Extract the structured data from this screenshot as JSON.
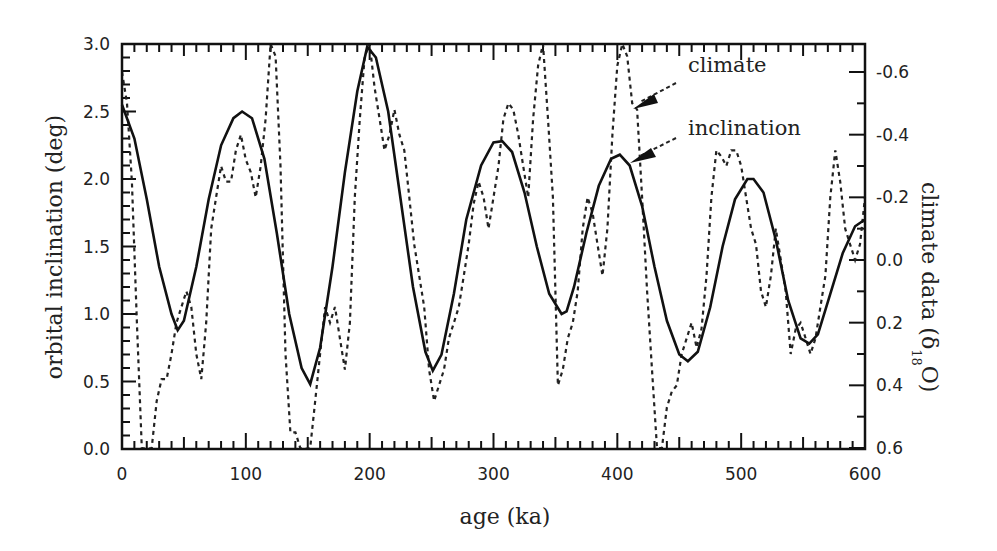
{
  "chart_data": {
    "type": "line",
    "title": "",
    "xlabel": "age (ka)",
    "ylabel": "orbital inclination (deg)",
    "ylabel_right": "climate data (δ18O)",
    "xlim": [
      0,
      600
    ],
    "ylim": [
      0.0,
      3.0
    ],
    "ylim_right": [
      0.6,
      -0.6
    ],
    "grid": false,
    "x_ticks": [
      "0",
      "100",
      "200",
      "300",
      "400",
      "500",
      "600"
    ],
    "y_ticks": [
      "0.0",
      "0.5",
      "1.0",
      "1.5",
      "2.0",
      "2.5",
      "3.0"
    ],
    "y_ticks_right": [
      "-0.6",
      "-0.4",
      "-0.2",
      "0.0",
      "0.2",
      "0.4",
      "0.6"
    ],
    "annotations": [
      {
        "text": "climate",
        "target_age": 413,
        "arrow": true
      },
      {
        "text": "inclination",
        "target_age": 405,
        "arrow": true
      }
    ],
    "series": [
      {
        "name": "inclination",
        "axis": "left",
        "style": "solid",
        "x": [
          0,
          10,
          20,
          30,
          40,
          45,
          50,
          60,
          70,
          80,
          90,
          97,
          105,
          115,
          125,
          135,
          145,
          152,
          160,
          170,
          180,
          190,
          198,
          205,
          215,
          225,
          235,
          245,
          251,
          258,
          268,
          278,
          290,
          300,
          307,
          315,
          325,
          335,
          345,
          355,
          359,
          365,
          375,
          385,
          395,
          402,
          410,
          420,
          430,
          440,
          450,
          457,
          465,
          475,
          485,
          495,
          505,
          510,
          518,
          528,
          538,
          548,
          555,
          562,
          572,
          582,
          592,
          600
        ],
        "values": [
          2.55,
          2.3,
          1.85,
          1.35,
          1.0,
          0.88,
          0.95,
          1.35,
          1.85,
          2.25,
          2.45,
          2.5,
          2.45,
          2.15,
          1.6,
          1.0,
          0.6,
          0.48,
          0.75,
          1.35,
          2.05,
          2.65,
          2.98,
          2.9,
          2.5,
          1.85,
          1.2,
          0.72,
          0.58,
          0.7,
          1.15,
          1.7,
          2.1,
          2.27,
          2.28,
          2.2,
          1.9,
          1.5,
          1.15,
          1.0,
          1.02,
          1.2,
          1.6,
          1.95,
          2.15,
          2.18,
          2.1,
          1.8,
          1.35,
          0.95,
          0.7,
          0.65,
          0.72,
          1.05,
          1.5,
          1.85,
          2.0,
          2.0,
          1.9,
          1.55,
          1.1,
          0.82,
          0.78,
          0.85,
          1.15,
          1.45,
          1.65,
          1.7
        ]
      },
      {
        "name": "climate",
        "axis": "right",
        "style": "dashed",
        "x": [
          0,
          4,
          8,
          12,
          16,
          20,
          24,
          28,
          32,
          36,
          40,
          44,
          48,
          52,
          56,
          60,
          64,
          68,
          72,
          76,
          80,
          84,
          88,
          92,
          96,
          100,
          104,
          108,
          112,
          116,
          120,
          124,
          128,
          132,
          136,
          140,
          144,
          148,
          152,
          156,
          160,
          164,
          168,
          172,
          176,
          180,
          184,
          188,
          192,
          196,
          200,
          204,
          208,
          212,
          216,
          220,
          224,
          228,
          232,
          236,
          240,
          244,
          248,
          252,
          256,
          260,
          264,
          268,
          272,
          276,
          280,
          284,
          288,
          292,
          296,
          300,
          304,
          308,
          312,
          316,
          320,
          324,
          328,
          332,
          336,
          340,
          344,
          348,
          352,
          356,
          360,
          364,
          368,
          372,
          376,
          380,
          384,
          388,
          392,
          396,
          400,
          404,
          408,
          412,
          416,
          420,
          424,
          428,
          432,
          436,
          440,
          444,
          448,
          452,
          456,
          460,
          464,
          468,
          472,
          476,
          480,
          484,
          488,
          492,
          496,
          500,
          504,
          508,
          512,
          516,
          520,
          524,
          528,
          532,
          536,
          540,
          544,
          548,
          552,
          556,
          560,
          564,
          568,
          572,
          576,
          580,
          584,
          588,
          592,
          596,
          600
        ],
        "values": [
          -0.6,
          -0.5,
          -0.25,
          0.2,
          0.6,
          0.63,
          0.6,
          0.45,
          0.38,
          0.38,
          0.3,
          0.2,
          0.15,
          0.1,
          0.15,
          0.3,
          0.38,
          0.2,
          -0.1,
          -0.2,
          -0.3,
          -0.25,
          -0.25,
          -0.35,
          -0.4,
          -0.32,
          -0.28,
          -0.2,
          -0.3,
          -0.45,
          -0.7,
          -0.65,
          -0.3,
          0.3,
          0.55,
          0.55,
          0.6,
          0.62,
          0.6,
          0.45,
          0.3,
          0.15,
          0.2,
          0.15,
          0.25,
          0.35,
          0.2,
          -0.2,
          -0.45,
          -0.65,
          -0.7,
          -0.55,
          -0.45,
          -0.35,
          -0.4,
          -0.48,
          -0.4,
          -0.35,
          -0.2,
          -0.05,
          0.05,
          0.15,
          0.35,
          0.45,
          0.4,
          0.35,
          0.25,
          0.2,
          0.15,
          0.05,
          -0.05,
          -0.18,
          -0.25,
          -0.2,
          -0.1,
          -0.2,
          -0.3,
          -0.45,
          -0.5,
          -0.48,
          -0.4,
          -0.3,
          -0.2,
          -0.45,
          -0.62,
          -0.7,
          -0.45,
          -0.2,
          0.4,
          0.35,
          0.25,
          0.2,
          0.1,
          -0.1,
          -0.2,
          -0.15,
          -0.05,
          0.05,
          -0.1,
          -0.4,
          -0.62,
          -0.7,
          -0.65,
          -0.5,
          -0.48,
          -0.2,
          0.1,
          0.35,
          0.6,
          0.6,
          0.47,
          0.42,
          0.4,
          0.3,
          0.25,
          0.2,
          0.28,
          0.22,
          0.05,
          -0.2,
          -0.35,
          -0.33,
          -0.3,
          -0.35,
          -0.35,
          -0.3,
          -0.2,
          -0.1,
          -0.05,
          0.1,
          0.15,
          0.05,
          -0.1,
          0.0,
          0.1,
          0.3,
          0.22,
          0.2,
          0.25,
          0.3,
          0.25,
          0.15,
          0.05,
          -0.2,
          -0.35,
          -0.25,
          -0.1,
          -0.05,
          0.0,
          -0.05,
          -0.2
        ]
      }
    ]
  },
  "axes": {
    "xlabel": "age (ka)",
    "ylabel_left": "orbital inclination (deg)",
    "ylabel_right_main": "climate data (δ",
    "ylabel_right_sup": "18",
    "ylabel_right_tail": "O)"
  },
  "legend": {
    "climate": "climate",
    "inclination": "inclination"
  }
}
